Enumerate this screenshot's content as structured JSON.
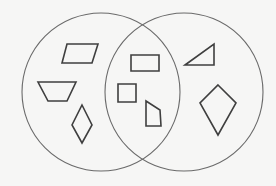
{
  "diagram": {
    "type": "venn",
    "width": 276,
    "height": 186,
    "background": "#f6f6f5",
    "circle_stroke": "#6a6a6a",
    "shape_stroke": "#3f3f3f",
    "circles": [
      {
        "id": "left",
        "cx": 101,
        "cy": 92,
        "r": 79
      },
      {
        "id": "right",
        "cx": 184,
        "cy": 92,
        "r": 79
      }
    ],
    "regions": {
      "left_only": [
        {
          "name": "parallelogram",
          "points": "67,44 98,44 92,63 62,63"
        },
        {
          "name": "trapezoid",
          "points": "38,82 76,82 67,101 48,101"
        },
        {
          "name": "rhombus",
          "points": "82,105 92,125 82,143 72,125"
        }
      ],
      "intersection": [
        {
          "name": "rectangle",
          "points": "131,55 159,55 159,71 131,71"
        },
        {
          "name": "square",
          "points": "118,84 136,84 136,102 118,102"
        },
        {
          "name": "quadrilateral",
          "points": "146,101 160,110 161,126 146,126"
        }
      ],
      "right_only": [
        {
          "name": "right-triangle",
          "points": "185,65 214,44 214,65"
        },
        {
          "name": "kite",
          "points": "218,85 236,103 218,135 200,103"
        }
      ]
    }
  }
}
